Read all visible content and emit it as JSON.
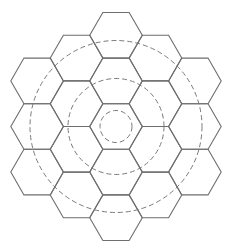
{
  "diagram": {
    "title": "",
    "center": [
      116,
      126.5
    ],
    "hex": {
      "orientation": "flat-top",
      "circumradius": 26.3,
      "half_height": 22.8,
      "stroke_color": "#6e6e6e",
      "cells": [
        {
          "q": 0,
          "r": -2
        },
        {
          "q": 1,
          "r": -2
        },
        {
          "q": 2,
          "r": -2
        },
        {
          "q": -1,
          "r": -1
        },
        {
          "q": 0,
          "r": -1
        },
        {
          "q": 1,
          "r": -1
        },
        {
          "q": 2,
          "r": -1
        },
        {
          "q": -2,
          "r": 0
        },
        {
          "q": -1,
          "r": 0
        },
        {
          "q": 0,
          "r": 0
        },
        {
          "q": 1,
          "r": 0
        },
        {
          "q": 2,
          "r": 0
        },
        {
          "q": -2,
          "r": 1
        },
        {
          "q": -1,
          "r": 1
        },
        {
          "q": 0,
          "r": 1
        },
        {
          "q": 1,
          "r": 1
        },
        {
          "q": -2,
          "r": 2
        },
        {
          "q": -1,
          "r": 2
        },
        {
          "q": 0,
          "r": 2
        }
      ]
    },
    "circles": [
      {
        "name": "inner-ring",
        "radius": 16,
        "style": "dashed"
      },
      {
        "name": "middle-ring",
        "radius": 48,
        "style": "dashed"
      },
      {
        "name": "outer-ring",
        "radius": 86,
        "style": "dashed"
      }
    ],
    "circle_color": "#7a7a7a"
  }
}
